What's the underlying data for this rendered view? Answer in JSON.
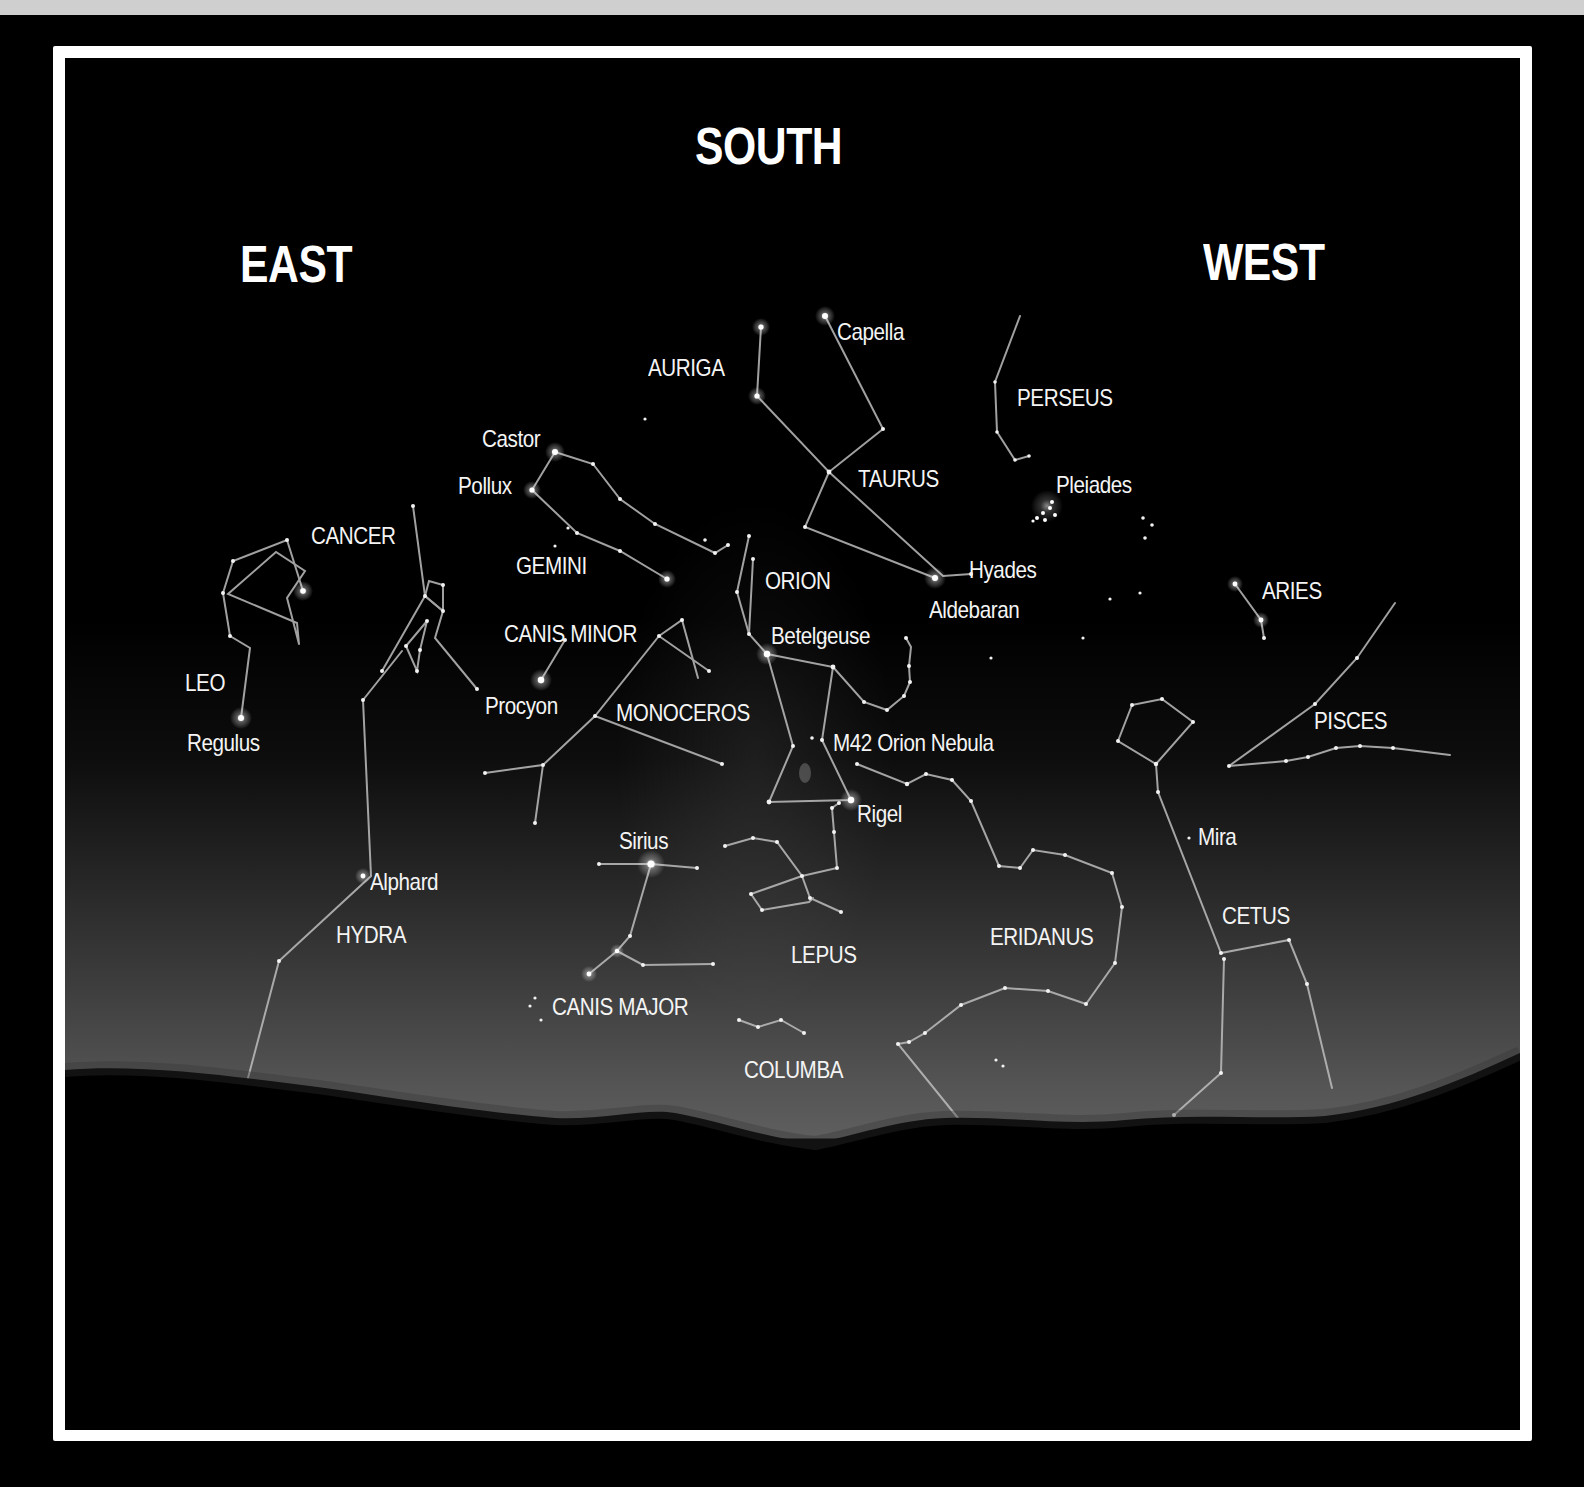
{
  "directions": {
    "south": "SOUTH",
    "east": "EAST",
    "west": "WEST"
  },
  "constellations": {
    "auriga": "AURIGA",
    "perseus": "PERSEUS",
    "taurus": "TAURUS",
    "gemini": "GEMINI",
    "cancer": "CANCER",
    "orion": "ORION",
    "aries": "ARIES",
    "canis_minor": "CANIS MINOR",
    "leo": "LEO",
    "monoceros": "MONOCEROS",
    "pisces": "PISCES",
    "hydra": "HYDRA",
    "cetus": "CETUS",
    "eridanus": "ERIDANUS",
    "lepus": "LEPUS",
    "canis_major": "CANIS MAJOR",
    "columba": "COLUMBA"
  },
  "stars": {
    "capella": "Capella",
    "castor": "Castor",
    "pollux": "Pollux",
    "pleiades": "Pleiades",
    "hyades": "Hyades",
    "aldebaran": "Aldebaran",
    "betelgeuse": "Betelgeuse",
    "procyon": "Procyon",
    "regulus": "Regulus",
    "m42": "M42 Orion Nebula",
    "rigel": "Rigel",
    "sirius": "Sirius",
    "mira": "Mira",
    "alphard": "Alphard"
  },
  "colors": {
    "sky_top": "#000000",
    "sky_horizon": "#5e5e5e",
    "frame": "#ffffff",
    "top_strip": "#cfcfcf",
    "label": "#f4f4f4"
  }
}
